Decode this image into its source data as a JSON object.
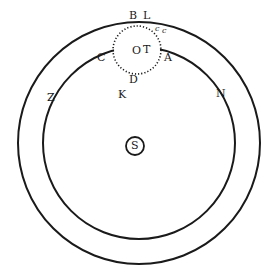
{
  "figure": {
    "type": "astronomical-orbit-diagram",
    "colors": {
      "ink": "#1a1a1a",
      "background": "#ffffff"
    },
    "orbits": [
      {
        "name": "outer-orbit",
        "cx": 139,
        "cy": 143,
        "r": 121
      },
      {
        "name": "inner-orbit",
        "cx": 139,
        "cy": 143,
        "r": 96
      }
    ],
    "dotted_circle": {
      "name": "earth-sphere",
      "cx": 137,
      "cy": 50,
      "r": 24
    },
    "sun": {
      "label": "S",
      "cx": 135,
      "cy": 146,
      "r": 9
    },
    "labels": {
      "B": "B",
      "L": "L",
      "c1": "c",
      "c2": "c",
      "O": "O",
      "T": "T",
      "A": "A",
      "C": "C",
      "D": "D",
      "K": "K",
      "Z": "Z",
      "N": "N",
      "S": "S"
    }
  }
}
